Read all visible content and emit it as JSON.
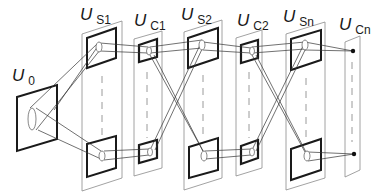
{
  "diagram": {
    "type": "neocognitron-layer-diagram",
    "labels": {
      "u0": {
        "main": "U",
        "sub": "0"
      },
      "us1": {
        "main": "U",
        "sub": "S1"
      },
      "uc1": {
        "main": "U",
        "sub": "C1"
      },
      "us2": {
        "main": "U",
        "sub": "S2"
      },
      "uc2": {
        "main": "U",
        "sub": "C2"
      },
      "usn": {
        "main": "U",
        "sub": "Sn"
      },
      "ucn": {
        "main": "U",
        "sub": "Cn"
      }
    },
    "layers": [
      {
        "id": "U0",
        "kind": "input"
      },
      {
        "id": "US1",
        "kind": "S-layer"
      },
      {
        "id": "UC1",
        "kind": "C-layer"
      },
      {
        "id": "US2",
        "kind": "S-layer"
      },
      {
        "id": "UC2",
        "kind": "C-layer"
      },
      {
        "id": "USn",
        "kind": "S-layer"
      },
      {
        "id": "UCn",
        "kind": "C-layer"
      }
    ],
    "colors": {
      "line": "#1a1a1a",
      "panel": "#8a8a8a",
      "background": "#ffffff"
    }
  }
}
